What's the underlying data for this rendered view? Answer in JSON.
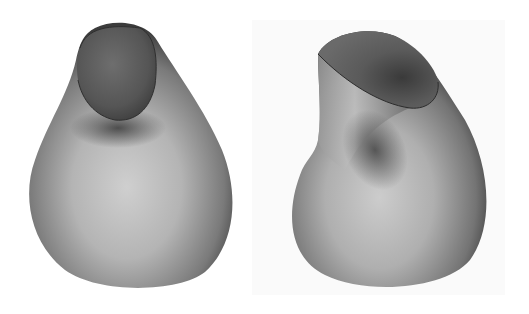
{
  "figure": {
    "panels": [
      {
        "id": "left",
        "description": "3D shaded surface, pear-shaped body with elliptical opening at top (front view)",
        "colors": {
          "background": "#ffffff",
          "surface_light": "#c8c8c8",
          "surface_dark": "#3a3a3a",
          "opening": "#5a5a5a"
        }
      },
      {
        "id": "right",
        "description": "3D shaded surface, twisted pear/jug shape with open top lip (rotated view)",
        "colors": {
          "background": "#fafafa",
          "surface_light": "#c4c4c4",
          "surface_dark": "#353535",
          "opening": "#555555"
        }
      }
    ]
  }
}
